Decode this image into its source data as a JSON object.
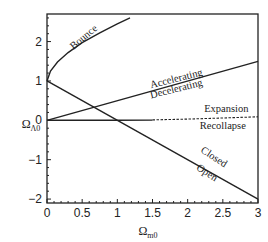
{
  "chart_data": {
    "type": "line",
    "title": "",
    "xlabel": "Ω_m0",
    "ylabel": "Ω_Λ0",
    "xlabel_main": "Ω",
    "xlabel_sub": "m0",
    "ylabel_main": "Ω",
    "ylabel_sub": "Λ0",
    "xlim": [
      0,
      3
    ],
    "ylim": [
      -2.1,
      2.7
    ],
    "grid": false,
    "legend": "none",
    "x_ticks": [
      "0",
      "0.5",
      "1",
      "1.5",
      "2",
      "2.5",
      "3"
    ],
    "y_ticks": [
      "-2",
      "-1",
      "0",
      "1",
      "2"
    ],
    "series": [
      {
        "name": "Bounce boundary",
        "style": "solid",
        "x": [
          0,
          0.05,
          0.15,
          0.3,
          0.5,
          0.75,
          1.0,
          1.18
        ],
        "y": [
          1.0,
          1.25,
          1.48,
          1.72,
          1.97,
          2.22,
          2.45,
          2.6
        ]
      },
      {
        "name": "Accelerating/Decelerating boundary",
        "style": "solid",
        "x": [
          0,
          3
        ],
        "y": [
          0,
          1.5
        ]
      },
      {
        "name": "Closed/Open boundary",
        "style": "solid",
        "x": [
          0,
          3
        ],
        "y": [
          1,
          -2
        ]
      },
      {
        "name": "Expansion/Recollapse boundary (Ω_m0 ≤ 1)",
        "style": "solid",
        "x": [
          0,
          1
        ],
        "y": [
          0,
          0
        ]
      },
      {
        "name": "Expansion/Recollapse boundary (Ω_m0 > 1)",
        "style": "solid",
        "x": [
          1,
          1.5
        ],
        "y": [
          0,
          0.005
        ]
      },
      {
        "name": "Expansion/Recollapse boundary (dashed)",
        "style": "dashed",
        "x": [
          1.5,
          2.0,
          2.5,
          3.0
        ],
        "y": [
          0.01,
          0.03,
          0.06,
          0.09
        ]
      }
    ],
    "annotations": [
      {
        "text": "Bounce",
        "x": 0.55,
        "y": 2.05,
        "rotation": -40
      },
      {
        "text": "Accelerating",
        "x": 1.85,
        "y": 0.98,
        "rotation": -14
      },
      {
        "text": "Decelerating",
        "x": 1.85,
        "y": 0.72,
        "rotation": -14
      },
      {
        "text": "Expansion",
        "x": 2.55,
        "y": 0.22,
        "rotation": 0
      },
      {
        "text": "Recollapse",
        "x": 2.5,
        "y": -0.22,
        "rotation": 0
      },
      {
        "text": "Closed",
        "x": 2.35,
        "y": -1.0,
        "rotation": 33
      },
      {
        "text": "Open",
        "x": 2.25,
        "y": -1.4,
        "rotation": 33
      }
    ]
  },
  "labels": {
    "bounce": "Bounce",
    "accelerating": "Accelerating",
    "decelerating": "Decelerating",
    "expansion": "Expansion",
    "recollapse": "Recollapse",
    "closed": "Closed",
    "open": "Open"
  }
}
